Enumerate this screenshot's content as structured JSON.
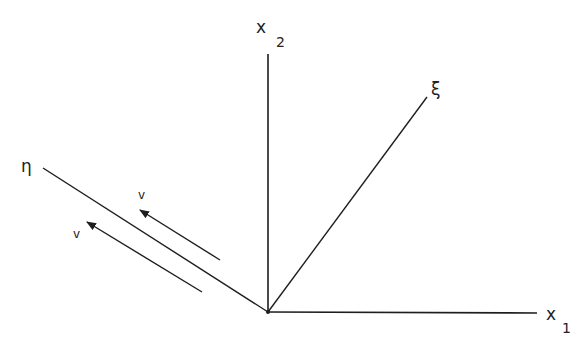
{
  "diagram": {
    "type": "coordinate-axes",
    "colors": {
      "line": "#1e1e1e",
      "background": "#ffffff"
    },
    "origin": [
      268,
      312
    ],
    "labels": {
      "x2_main": "x",
      "x2_sub": "2",
      "x1_main": "x",
      "x1_sub": "1",
      "xi": "ξ",
      "eta": "η",
      "v_upper": "v",
      "v_lower": "v"
    },
    "axes": [
      {
        "name": "x1",
        "from": [
          268,
          312
        ],
        "to": [
          537,
          313
        ]
      },
      {
        "name": "x2",
        "from": [
          268,
          312
        ],
        "to": [
          268,
          54
        ]
      },
      {
        "name": "xi",
        "from": [
          268,
          312
        ],
        "to": [
          427,
          97
        ]
      },
      {
        "name": "eta",
        "from": [
          268,
          312
        ],
        "to": [
          43,
          168
        ]
      }
    ],
    "arrows": [
      {
        "name": "velocity-upper",
        "tail": [
          220,
          260
        ],
        "tip": [
          140,
          210
        ]
      },
      {
        "name": "velocity-lower",
        "tail": [
          202,
          292
        ],
        "tip": [
          87,
          222
        ]
      }
    ]
  }
}
